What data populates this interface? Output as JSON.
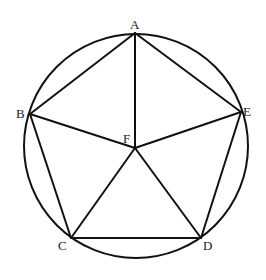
{
  "diagram": {
    "type": "geometry",
    "circle": {
      "cx": 136,
      "cy": 146,
      "r": 112
    },
    "points": {
      "A": {
        "label": "A",
        "x": 135,
        "y": 33
      },
      "B": {
        "label": "B",
        "x": 30,
        "y": 114
      },
      "C": {
        "label": "C",
        "x": 71,
        "y": 238
      },
      "D": {
        "label": "D",
        "x": 201,
        "y": 238
      },
      "E": {
        "label": "E",
        "x": 241,
        "y": 112
      },
      "F": {
        "label": "F",
        "x": 135,
        "y": 148
      }
    },
    "segments": [
      [
        "A",
        "B"
      ],
      [
        "B",
        "C"
      ],
      [
        "C",
        "D"
      ],
      [
        "D",
        "E"
      ],
      [
        "E",
        "A"
      ],
      [
        "F",
        "A"
      ],
      [
        "F",
        "B"
      ],
      [
        "F",
        "C"
      ],
      [
        "F",
        "D"
      ],
      [
        "F",
        "E"
      ]
    ]
  }
}
